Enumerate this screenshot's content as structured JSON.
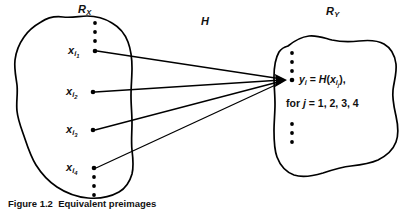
{
  "figure": {
    "type": "set-mapping-diagram",
    "background_color": "#ffffff",
    "ink_color": "#000000",
    "domain_set": {
      "label_base": "R",
      "label_sub": "X",
      "label_full": "R_X"
    },
    "codomain_set": {
      "label_base": "R",
      "label_sub": "Y",
      "label_full": "R_Y"
    },
    "mapping": {
      "label": "H"
    },
    "domain_elements": [
      {
        "base": "x",
        "sub": "i",
        "subsub": "1"
      },
      {
        "base": "x",
        "sub": "i",
        "subsub": "2"
      },
      {
        "base": "x",
        "sub": "i",
        "subsub": "3"
      },
      {
        "base": "x",
        "sub": "i",
        "subsub": "4"
      }
    ],
    "codomain_formula": {
      "line1_parts": {
        "y": "y",
        "y_sub": "i",
        "eq": " = ",
        "H": "H",
        "open": "(",
        "x": "x",
        "x_sub": "i",
        "x_subsub": "j",
        "close": "),"
      },
      "line1_plain": "y_i = H(x_i_j),",
      "line2_prefix": "for ",
      "line2_var": "j",
      "line2_rest": " = 1, 2, 3, 4",
      "line2_plain": "for j = 1, 2, 3, 4"
    },
    "vertical_dots": {
      "glyph": "ellipsis-vertical",
      "groups": [
        {
          "name": "domain-top-dots",
          "count": 4
        },
        {
          "name": "domain-bottom-dots",
          "count": 4
        },
        {
          "name": "codomain-top-dots",
          "count": 4
        },
        {
          "name": "codomain-bottom-dots",
          "count": 3
        }
      ]
    },
    "arrows": {
      "count": 4,
      "style": "converging-to-single-point",
      "head": "filled-triangle"
    },
    "caption": {
      "title": "Figure 1.2",
      "text": "Equivalent preimages"
    }
  }
}
